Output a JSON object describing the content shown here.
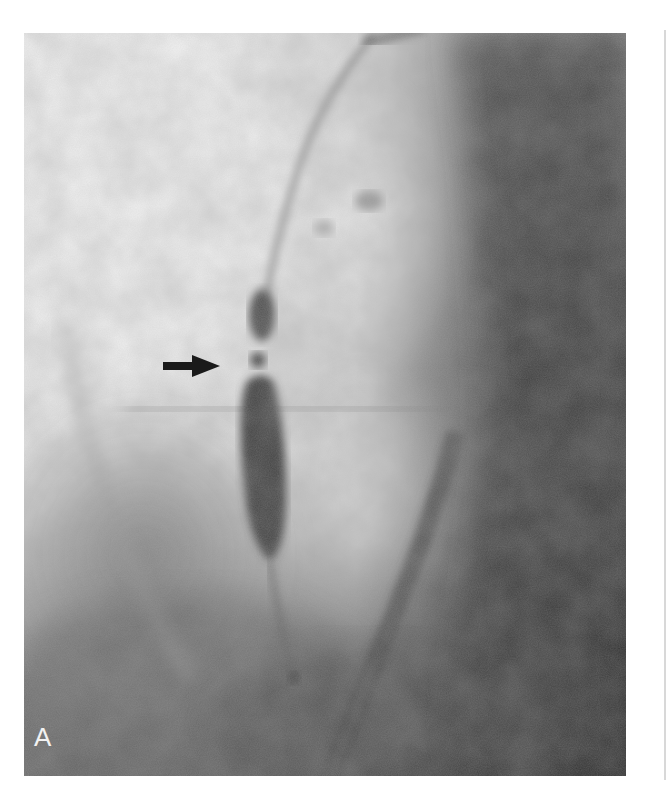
{
  "figure": {
    "panel_label": "A",
    "annotation": "arrow pointing right at narrowing",
    "colors": {
      "bright": "#f4f4f4",
      "mid": "#a8a8a8",
      "dark": "#3c3c3c",
      "darkest": "#2a2a2a",
      "arrow": "#1a1a1a",
      "page": "#ffffff"
    }
  }
}
